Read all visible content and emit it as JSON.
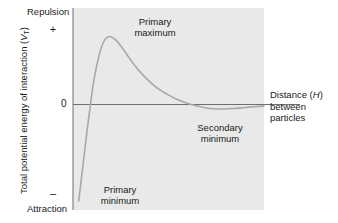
{
  "chart_data": {
    "type": "line",
    "title": "",
    "subtitle": "",
    "xlabel": "Distance (H) between particles",
    "ylabel": "Total potential energy of interaction (VT)",
    "grid": false,
    "legend": null,
    "axis_notes": {
      "y_positive_direction": "Repulsion",
      "y_negative_direction": "Attraction",
      "y_zero_tick": "0",
      "y_plus_sign": "+",
      "y_minus_sign": "–"
    },
    "ylim": [
      -1.05,
      1.05
    ],
    "xlim": [
      0,
      1
    ],
    "yticks": [
      0
    ],
    "ytick_labels": [
      "0"
    ],
    "xticks": [],
    "xtick_labels": [],
    "series": [
      {
        "name": "DLVO total potential energy",
        "color": "#a8a8a8",
        "x": [
          0.03,
          0.045,
          0.06,
          0.075,
          0.09,
          0.11,
          0.135,
          0.16,
          0.19,
          0.225,
          0.26,
          0.3,
          0.345,
          0.39,
          0.44,
          0.49,
          0.54,
          0.59,
          0.64,
          0.69,
          0.74,
          0.79,
          0.84,
          0.9,
          0.96,
          1.0
        ],
        "y": [
          -0.96,
          -0.72,
          -0.48,
          -0.24,
          -0.02,
          0.27,
          0.52,
          0.68,
          0.74,
          0.7,
          0.61,
          0.49,
          0.37,
          0.27,
          0.18,
          0.115,
          0.06,
          0.02,
          -0.01,
          -0.032,
          -0.043,
          -0.045,
          -0.04,
          -0.03,
          -0.02,
          -0.015
        ]
      }
    ],
    "annotations": [
      {
        "id": "primary-maximum",
        "text_line1": "Primary",
        "text_line2": "maximum",
        "x": 0.21,
        "y": 0.74
      },
      {
        "id": "secondary-minimum",
        "text_line1": "Secondary",
        "text_line2": "minimum",
        "x": 0.76,
        "y": -0.045
      },
      {
        "id": "primary-minimum",
        "text_line1": "Primary",
        "text_line2": "minimum",
        "x": 0.06,
        "y": -0.95
      }
    ],
    "colors": {
      "plot_background": "#e9e9e9",
      "page_background": "#ffffff",
      "axis_line": "#6e6e6e",
      "curve": "#a8a8a8",
      "text": "#1a1a1a"
    }
  },
  "labels": {
    "repulsion": "Repulsion",
    "attraction": "Attraction",
    "plus": "+",
    "minus": "–",
    "zero": "0",
    "y_axis_main": "Total potential energy of interaction (",
    "y_axis_symbol": "V",
    "y_axis_subscript": "T",
    "y_axis_close": ")",
    "primary_maximum_line1": "Primary",
    "primary_maximum_line2": "maximum",
    "secondary_minimum_line1": "Secondary",
    "secondary_minimum_line2": "minimum",
    "primary_minimum_line1": "Primary",
    "primary_minimum_line2": "minimum",
    "x_axis_line1_pre": "Distance (",
    "x_axis_line1_sym": "H",
    "x_axis_line1_post": ")",
    "x_axis_line2": "between",
    "x_axis_line3": "particles"
  }
}
